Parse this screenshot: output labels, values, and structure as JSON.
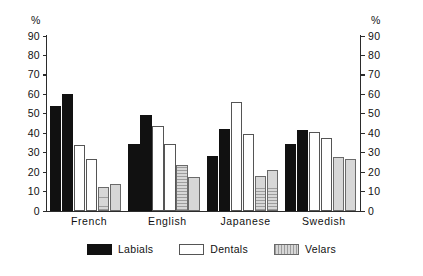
{
  "chart_data": {
    "type": "bar",
    "title": "",
    "xlabel": "",
    "ylabel": "%",
    "ylabel_right": "%",
    "ylim": [
      0,
      90
    ],
    "yticks": [
      0,
      10,
      20,
      30,
      40,
      50,
      60,
      70,
      80,
      90
    ],
    "grid": false,
    "legend_position": "bottom",
    "categories": [
      "French",
      "English",
      "Japanese",
      "Swedish"
    ],
    "series": [
      {
        "name": "Labials",
        "color": "#111111",
        "values": [
          [
            54,
            60
          ],
          [
            34.5,
            49.5
          ],
          [
            28.5,
            42
          ],
          [
            34.5,
            41.5
          ]
        ]
      },
      {
        "name": "Dentals",
        "color": "#ffffff",
        "values": [
          [
            34,
            26.5
          ],
          [
            43.5,
            34.5
          ],
          [
            56,
            39.5
          ],
          [
            40.5,
            37.5
          ]
        ]
      },
      {
        "name": "Velars",
        "color": "#d7d7d7",
        "values": [
          [
            12.5,
            14
          ],
          [
            23.5,
            17.5
          ],
          [
            18,
            21
          ],
          [
            28,
            26.5
          ]
        ]
      }
    ],
    "legend": [
      "Labials",
      "Dentals",
      "Velars"
    ]
  },
  "axes": {
    "left": {
      "unit": "%",
      "ticks": [
        "90",
        "80",
        "70",
        "60",
        "50",
        "40",
        "30",
        "20",
        "10",
        "0"
      ]
    },
    "right": {
      "unit": "%",
      "ticks": [
        "90",
        "80",
        "70",
        "60",
        "50",
        "40",
        "30",
        "20",
        "10",
        "0"
      ]
    }
  }
}
